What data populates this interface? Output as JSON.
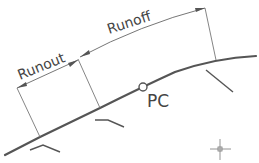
{
  "diagram": {
    "type": "superelevation-transition",
    "labels": {
      "runout": "Runout",
      "runoff": "Runoff",
      "pc": "PC"
    },
    "colors": {
      "line": "#555555",
      "thin_line": "#777777",
      "text": "#444444",
      "background": "#ffffff"
    }
  }
}
